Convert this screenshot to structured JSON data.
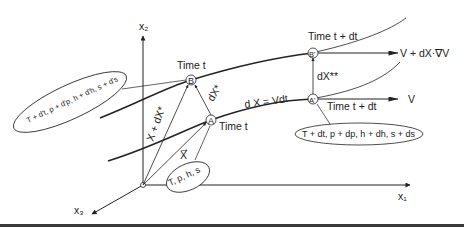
{
  "axes": {
    "x1": "x₁",
    "x2": "x₂",
    "x3": "x₃"
  },
  "points": {
    "A": "A",
    "B": "B",
    "A_prime": "A'",
    "B_prime": "B'"
  },
  "labels": {
    "time_t_B": "Time t",
    "time_t_A": "Time t",
    "time_tdt_B": "Time t + dt",
    "time_tdt_A": "Time t + dt",
    "vec_X": "X",
    "vec_X_plus_dXstar": "X + dX*",
    "vec_dXstar": "dX*",
    "vec_dXstarstar": "dX**",
    "dX_eq_Vdt": "d X = Vdt",
    "V": "V",
    "V_plus": "V + dX·∇V"
  },
  "ellipses": {
    "state_A": "T, p, h, s",
    "state_A_prime": "T + dt, p + dp, h + dh, s + ds",
    "state_B": "T + d't, p + d'p, h + d'h, s + d's"
  },
  "colors": {
    "ink": "#222222",
    "background": "#ffffff",
    "rule": "#3a3a3a"
  }
}
